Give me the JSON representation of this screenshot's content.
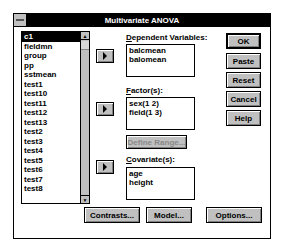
{
  "window": {
    "title": "Multivariate ANOVA"
  },
  "source_list": {
    "items": [
      "c1",
      "fieldmn",
      "group",
      "pp",
      "sstmean",
      "test1",
      "test10",
      "test11",
      "test12",
      "test13",
      "test2",
      "test3",
      "test4",
      "test5",
      "test6",
      "test7",
      "test8"
    ],
    "selected_index": 0
  },
  "dependent": {
    "label_prefix": "D",
    "label_rest": "ependent Variables:",
    "items": [
      "balcmean",
      "balomean"
    ]
  },
  "factors": {
    "label_prefix": "F",
    "label_rest": "actor(s):",
    "items": [
      "sex(1 2)",
      "field(1 3)"
    ],
    "define_range_label": "Define Range..."
  },
  "covariates": {
    "label_prefix": "C",
    "label_rest": "ovariate(s):",
    "items": [
      "age",
      "height"
    ]
  },
  "side_buttons": {
    "ok": "OK",
    "paste": "Paste",
    "reset": "Reset",
    "cancel": "Cancel",
    "help": "Help"
  },
  "bottom_buttons": {
    "contrasts": "Contrasts...",
    "model": "Model...",
    "options": "Options..."
  }
}
